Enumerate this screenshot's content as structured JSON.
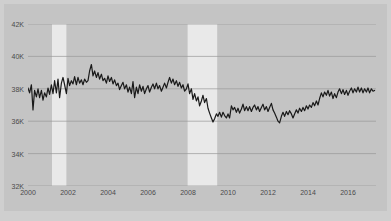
{
  "figure": {
    "background_color": "#cfcfcf",
    "plot_background_color": "#c4c4c4",
    "frame_color": "#c4c4c4"
  },
  "chart_data": {
    "type": "line",
    "title": "",
    "subtitle": "",
    "xlabel": "",
    "ylabel": "",
    "grid": true,
    "grid_color": "#9a9a9a",
    "legend_position": "none",
    "line_color": "#1a1a1a",
    "line_width": 1.2,
    "xlim": [
      2000.0,
      2017.4
    ],
    "ylim": [
      32000,
      42000
    ],
    "xticks": [
      2000,
      2002,
      2004,
      2006,
      2008,
      2010,
      2012,
      2014,
      2016
    ],
    "xtick_labels": [
      "2000",
      "2002",
      "2004",
      "2006",
      "2008",
      "2010",
      "2012",
      "2014",
      "2016"
    ],
    "yticks": [
      32000,
      34000,
      36000,
      38000,
      40000,
      42000
    ],
    "ytick_labels": [
      "32K",
      "34K",
      "36K",
      "38K",
      "40K",
      "42K"
    ],
    "shaded_regions": [
      {
        "label": "recession-2001",
        "start": 2001.2,
        "end": 2001.92,
        "color": "#e9e9e9"
      },
      {
        "label": "recession-2008",
        "start": 2007.98,
        "end": 2009.46,
        "color": "#e9e9e9"
      }
    ],
    "series": [
      {
        "name": "value",
        "x": [
          2000.0,
          2000.08,
          2000.17,
          2000.25,
          2000.33,
          2000.42,
          2000.5,
          2000.58,
          2000.67,
          2000.75,
          2000.83,
          2000.92,
          2001.0,
          2001.08,
          2001.17,
          2001.25,
          2001.33,
          2001.42,
          2001.5,
          2001.58,
          2001.67,
          2001.75,
          2001.83,
          2001.92,
          2002.0,
          2002.08,
          2002.17,
          2002.25,
          2002.33,
          2002.42,
          2002.5,
          2002.58,
          2002.67,
          2002.75,
          2002.83,
          2002.92,
          2003.0,
          2003.08,
          2003.17,
          2003.25,
          2003.33,
          2003.42,
          2003.5,
          2003.58,
          2003.67,
          2003.75,
          2003.83,
          2003.92,
          2004.0,
          2004.08,
          2004.17,
          2004.25,
          2004.33,
          2004.42,
          2004.5,
          2004.58,
          2004.67,
          2004.75,
          2004.83,
          2004.92,
          2005.0,
          2005.08,
          2005.17,
          2005.25,
          2005.33,
          2005.42,
          2005.5,
          2005.58,
          2005.67,
          2005.75,
          2005.83,
          2005.92,
          2006.0,
          2006.08,
          2006.17,
          2006.25,
          2006.33,
          2006.42,
          2006.5,
          2006.58,
          2006.67,
          2006.75,
          2006.83,
          2006.92,
          2007.0,
          2007.08,
          2007.17,
          2007.25,
          2007.33,
          2007.42,
          2007.5,
          2007.58,
          2007.67,
          2007.75,
          2007.83,
          2007.92,
          2008.0,
          2008.08,
          2008.17,
          2008.25,
          2008.33,
          2008.42,
          2008.5,
          2008.58,
          2008.67,
          2008.75,
          2008.83,
          2008.92,
          2009.0,
          2009.08,
          2009.17,
          2009.25,
          2009.33,
          2009.42,
          2009.5,
          2009.58,
          2009.67,
          2009.75,
          2009.83,
          2009.92,
          2010.0,
          2010.08,
          2010.17,
          2010.25,
          2010.33,
          2010.42,
          2010.5,
          2010.58,
          2010.67,
          2010.75,
          2010.83,
          2010.92,
          2011.0,
          2011.08,
          2011.17,
          2011.25,
          2011.33,
          2011.42,
          2011.5,
          2011.58,
          2011.67,
          2011.75,
          2011.83,
          2011.92,
          2012.0,
          2012.08,
          2012.17,
          2012.25,
          2012.33,
          2012.42,
          2012.5,
          2012.58,
          2012.67,
          2012.75,
          2012.83,
          2012.92,
          2013.0,
          2013.08,
          2013.17,
          2013.25,
          2013.33,
          2013.42,
          2013.5,
          2013.58,
          2013.67,
          2013.75,
          2013.83,
          2013.92,
          2014.0,
          2014.08,
          2014.17,
          2014.25,
          2014.33,
          2014.42,
          2014.5,
          2014.58,
          2014.67,
          2014.75,
          2014.83,
          2014.92,
          2015.0,
          2015.08,
          2015.17,
          2015.25,
          2015.33,
          2015.42,
          2015.5,
          2015.58,
          2015.67,
          2015.75,
          2015.83,
          2015.92,
          2016.0,
          2016.08,
          2016.17,
          2016.25,
          2016.33,
          2016.42,
          2016.5,
          2016.58,
          2016.67,
          2016.75,
          2016.83,
          2016.92,
          2017.0,
          2017.08,
          2017.17,
          2017.25,
          2017.33
        ],
        "values": [
          38050,
          37750,
          38250,
          36700,
          37900,
          37500,
          38000,
          37450,
          37900,
          37300,
          37750,
          37500,
          38050,
          37650,
          38250,
          37700,
          38500,
          37750,
          38600,
          37450,
          38350,
          38700,
          38250,
          37700,
          38650,
          38200,
          38500,
          38300,
          38750,
          38250,
          38700,
          38350,
          38550,
          38250,
          38600,
          38400,
          38500,
          39100,
          39500,
          38800,
          39100,
          38700,
          39000,
          38600,
          38900,
          38500,
          38650,
          38350,
          38800,
          38450,
          38700,
          38300,
          38550,
          38200,
          38350,
          37950,
          38200,
          38400,
          38000,
          38250,
          37800,
          38100,
          37700,
          38450,
          37450,
          38100,
          37700,
          38250,
          37850,
          38150,
          37700,
          38000,
          38200,
          37800,
          38100,
          38300,
          38000,
          38350,
          38000,
          38200,
          37850,
          38100,
          38350,
          38050,
          38400,
          38700,
          38350,
          38600,
          38250,
          38500,
          38150,
          38400,
          38050,
          38250,
          37850,
          38000,
          38300,
          37700,
          38000,
          37350,
          37700,
          37250,
          37500,
          36950,
          37250,
          37600,
          37150,
          37400,
          36800,
          36500,
          36200,
          35950,
          36150,
          36450,
          36300,
          36550,
          36250,
          36550,
          36350,
          36200,
          36450,
          36200,
          36950,
          36700,
          36850,
          36550,
          36800,
          36500,
          36750,
          37050,
          36650,
          36900,
          36650,
          36900,
          36600,
          36850,
          37000,
          36700,
          36900,
          36600,
          36850,
          37050,
          36700,
          36900,
          36600,
          36850,
          37100,
          36700,
          36500,
          36250,
          36000,
          35900,
          36300,
          36550,
          36300,
          36600,
          36400,
          36650,
          36450,
          36200,
          36450,
          36700,
          36500,
          36800,
          36600,
          36850,
          36650,
          36950,
          36750,
          37000,
          36850,
          37150,
          36950,
          37250,
          37000,
          37400,
          37750,
          37500,
          37800,
          37600,
          37900,
          37550,
          37800,
          37400,
          37700,
          37450,
          37800,
          38000,
          37700,
          37950,
          37650,
          37900,
          37600,
          37850,
          38050,
          37750,
          38000,
          37800,
          38100,
          37800,
          38050,
          37750,
          38000,
          37800,
          38050,
          37750,
          38000,
          37850,
          37900
        ]
      }
    ]
  }
}
